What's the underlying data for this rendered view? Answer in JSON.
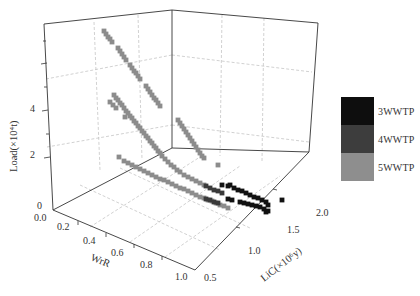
{
  "chart_data": {
    "type": "scatter3d",
    "title": "",
    "axes": {
      "x": {
        "label": "WrR",
        "ticks": [
          "0.0",
          "0.2",
          "0.4",
          "0.6",
          "0.8",
          "1.0"
        ],
        "range": [
          0,
          1.0
        ]
      },
      "y": {
        "label": "LiC(×10⁶y)",
        "ticks": [
          "0.5",
          "1.0",
          "1.5",
          "2.0"
        ],
        "range": [
          0.5,
          2.0
        ]
      },
      "z": {
        "label": "Load(×10⁴t)",
        "ticks": [
          "0",
          "2",
          "4"
        ],
        "range": [
          0,
          5.5
        ]
      }
    },
    "grid": true,
    "legend_position": "right",
    "legend": [
      {
        "name": "3WWTP",
        "color": "#111111"
      },
      {
        "name": "4WWTP",
        "color": "#3a3a3a"
      },
      {
        "name": "5WWTP",
        "color": "#8c8c8c"
      }
    ],
    "series": [
      {
        "name": "5WWTP",
        "color": "#8c8c8c",
        "description": "Upper curves: load decreases from ~5.3 to ~1 as WrR increases and LiC rises; lower band near WrR floor",
        "points_px": [
          [
            104,
            31
          ],
          [
            106,
            34
          ],
          [
            108,
            37
          ],
          [
            110,
            39
          ],
          [
            112,
            42
          ],
          [
            118,
            48
          ],
          [
            120,
            51
          ],
          [
            122,
            54
          ],
          [
            124,
            57
          ],
          [
            126,
            60
          ],
          [
            130,
            65
          ],
          [
            132,
            68
          ],
          [
            134,
            71
          ],
          [
            136,
            73
          ],
          [
            138,
            76
          ],
          [
            140,
            79
          ],
          [
            146,
            86
          ],
          [
            148,
            89
          ],
          [
            150,
            92
          ],
          [
            152,
            95
          ],
          [
            154,
            98
          ],
          [
            156,
            100
          ],
          [
            158,
            103
          ],
          [
            160,
            106
          ],
          [
            114,
            95
          ],
          [
            116,
            98
          ],
          [
            118,
            100
          ],
          [
            120,
            103
          ],
          [
            122,
            105
          ],
          [
            124,
            108
          ],
          [
            126,
            111
          ],
          [
            128,
            113
          ],
          [
            130,
            116
          ],
          [
            132,
            118
          ],
          [
            134,
            121
          ],
          [
            136,
            123
          ],
          [
            138,
            126
          ],
          [
            140,
            128
          ],
          [
            142,
            131
          ],
          [
            144,
            133
          ],
          [
            146,
            136
          ],
          [
            148,
            138
          ],
          [
            150,
            141
          ],
          [
            152,
            143
          ],
          [
            154,
            146
          ],
          [
            156,
            148
          ],
          [
            158,
            151
          ],
          [
            160,
            153
          ],
          [
            110,
            102
          ],
          [
            113,
            105
          ],
          [
            116,
            108
          ],
          [
            125,
            117
          ],
          [
            178,
            120
          ],
          [
            180,
            123
          ],
          [
            182,
            126
          ],
          [
            184,
            129
          ],
          [
            186,
            132
          ],
          [
            188,
            135
          ],
          [
            190,
            138
          ],
          [
            192,
            141
          ],
          [
            194,
            144
          ],
          [
            196,
            147
          ],
          [
            198,
            150
          ],
          [
            200,
            153
          ],
          [
            202,
            156
          ],
          [
            204,
            158
          ],
          [
            218,
            165
          ],
          [
            162,
            156
          ],
          [
            165,
            159
          ],
          [
            168,
            162
          ],
          [
            171,
            165
          ],
          [
            174,
            167
          ],
          [
            177,
            170
          ],
          [
            180,
            172
          ],
          [
            184,
            175
          ],
          [
            188,
            177
          ],
          [
            192,
            179
          ],
          [
            196,
            181
          ],
          [
            200,
            183
          ],
          [
            204,
            185
          ],
          [
            119,
            157
          ],
          [
            124,
            161
          ],
          [
            128,
            163
          ],
          [
            132,
            165
          ],
          [
            136,
            167
          ],
          [
            140,
            169
          ],
          [
            144,
            171
          ],
          [
            148,
            173
          ],
          [
            152,
            175
          ],
          [
            156,
            177
          ],
          [
            160,
            179
          ],
          [
            164,
            180
          ],
          [
            168,
            182
          ],
          [
            172,
            184
          ],
          [
            176,
            186
          ],
          [
            180,
            188
          ],
          [
            184,
            189
          ],
          [
            188,
            191
          ],
          [
            192,
            193
          ],
          [
            196,
            195
          ],
          [
            200,
            197
          ],
          [
            204,
            198
          ],
          [
            208,
            200
          ],
          [
            212,
            201
          ],
          [
            216,
            203
          ],
          [
            220,
            205
          ],
          [
            224,
            206
          ],
          [
            228,
            208
          ]
        ]
      },
      {
        "name": "4WWTP",
        "color": "#3a3a3a",
        "points_px": [
          [
            206,
            186
          ],
          [
            210,
            188
          ],
          [
            214,
            190
          ],
          [
            218,
            191
          ],
          [
            222,
            193
          ],
          [
            206,
            199
          ],
          [
            210,
            200
          ],
          [
            214,
            202
          ],
          [
            218,
            203
          ]
        ]
      },
      {
        "name": "3WWTP",
        "color": "#111111",
        "points_px": [
          [
            222,
            185
          ],
          [
            228,
            186
          ],
          [
            230,
            185
          ],
          [
            234,
            188
          ],
          [
            238,
            190
          ],
          [
            242,
            191
          ],
          [
            246,
            193
          ],
          [
            250,
            195
          ],
          [
            254,
            197
          ],
          [
            258,
            198
          ],
          [
            262,
            200
          ],
          [
            266,
            202
          ],
          [
            268,
            205
          ],
          [
            282,
            200
          ],
          [
            228,
            199
          ],
          [
            232,
            200
          ],
          [
            240,
            202
          ],
          [
            244,
            203
          ],
          [
            248,
            204
          ],
          [
            252,
            205
          ],
          [
            256,
            206
          ],
          [
            260,
            207
          ],
          [
            264,
            209
          ],
          [
            268,
            211
          ],
          [
            266,
            212
          ]
        ]
      }
    ]
  },
  "legend": {
    "items": [
      {
        "label": "3WWTP",
        "color": "#0e0e0e"
      },
      {
        "label": "4WWTP",
        "color": "#3d3d3d"
      },
      {
        "label": "5WWTP",
        "color": "#8e8e8e"
      }
    ]
  },
  "labels": {
    "z_axis": "Load(×10⁴t)",
    "x_axis": "WrR",
    "y_axis": "LiC(×10⁶y)",
    "z_ticks": [
      "0",
      "2",
      "4"
    ],
    "x_ticks": [
      "0.0",
      "0.2",
      "0.4",
      "0.6",
      "0.8",
      "1.0"
    ],
    "y_ticks": [
      "0.5",
      "1.0",
      "1.5",
      "2.0"
    ]
  }
}
